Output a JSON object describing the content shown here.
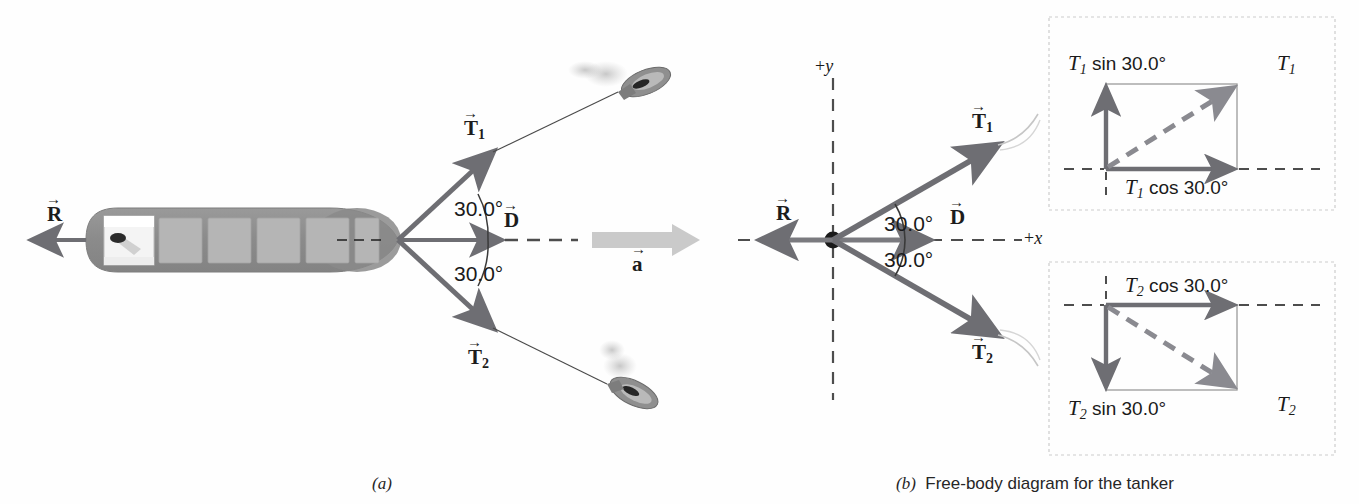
{
  "figure": {
    "colors": {
      "vector_gray": "#6e6e73",
      "hull_dark": "#8e8e8e",
      "hull_light": "#b4b4b4",
      "accel_gray": "#c9c9c9",
      "text_black": "#1a1a1a",
      "box_border": "#c9c9c9",
      "dashed_axis": "#555555"
    }
  },
  "panel_a": {
    "caption": "(a)",
    "caption_letter": "a",
    "vector_R": "R",
    "vector_T1": "T",
    "vector_T1_sub": "1",
    "vector_T2": "T",
    "vector_T2_sub": "2",
    "vector_D": "D",
    "vector_a": "a",
    "angle_upper": "30.0°",
    "angle_lower": "30.0°",
    "tugboat_upper": "tugboat-upper",
    "tugboat_lower": "tugboat-lower",
    "tanker": "tanker-hull"
  },
  "panel_b": {
    "caption_letter": "b",
    "caption_text": "Free-body diagram for the tanker",
    "axis_y": "+y",
    "axis_x": "+x",
    "vector_R": "R",
    "vector_T1": "T",
    "vector_T1_sub": "1",
    "vector_T2": "T",
    "vector_T2_sub": "2",
    "vector_D": "D",
    "angle_upper": "30.0°",
    "angle_lower": "30.0°"
  },
  "component_box_top": {
    "name": "T1-components",
    "vertical_label_sym": "T",
    "vertical_label_sub": "1",
    "vertical_label_fn": "sin 30.0°",
    "horizontal_label_sym": "T",
    "horizontal_label_sub": "1",
    "horizontal_label_fn": "cos 30.0°",
    "resultant_sym": "T",
    "resultant_sub": "1"
  },
  "component_box_bottom": {
    "name": "T2-components",
    "horizontal_label_sym": "T",
    "horizontal_label_sub": "2",
    "horizontal_label_fn": "cos 30.0°",
    "vertical_label_sym": "T",
    "vertical_label_sub": "2",
    "vertical_label_fn": "sin 30.0°",
    "resultant_sym": "T",
    "resultant_sub": "2"
  }
}
